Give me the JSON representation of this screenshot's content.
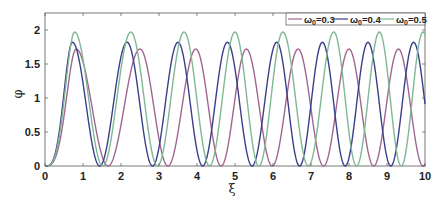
{
  "chart_data": {
    "type": "line",
    "title": "",
    "xlabel": "ξ",
    "ylabel": "φ",
    "xlim": [
      0,
      10
    ],
    "ylim": [
      0,
      2.25
    ],
    "xticks": [
      "0",
      "1",
      "2",
      "3",
      "4",
      "5",
      "6",
      "7",
      "8",
      "9",
      "10"
    ],
    "yticks": [
      "0",
      "0.5",
      "1",
      "1.5",
      "2"
    ],
    "grid": false,
    "legend_position": "top-right",
    "series": [
      {
        "name": "ω0=0.3",
        "legend_base": "ω",
        "legend_sub": "0",
        "legend_val": "=0.3",
        "color": "#a0668f",
        "amplitude": 1.72,
        "peaks": [
          0.82,
          2.5,
          3.97,
          5.3,
          6.66,
          8.0,
          9.3
        ]
      },
      {
        "name": "ω0=0.4",
        "legend_base": "ω",
        "legend_sub": "0",
        "legend_val": "=0.4",
        "color": "#3a3f8a",
        "amplitude": 1.82,
        "peaks": [
          0.72,
          2.16,
          3.5,
          4.8,
          6.1,
          7.3,
          8.5,
          9.7
        ]
      },
      {
        "name": "ω0=0.5",
        "legend_base": "ω",
        "legend_sub": "0",
        "legend_val": "=0.5",
        "color": "#7fb894",
        "amplitude": 1.97,
        "peaks": [
          0.78,
          2.26,
          3.66,
          5.0,
          6.26,
          7.6,
          8.8,
          9.95
        ]
      }
    ]
  }
}
